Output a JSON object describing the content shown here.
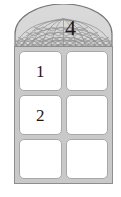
{
  "figure": {
    "name": "arched-window-with-geodesic-dome",
    "colors": {
      "frame": "#c9c9c9",
      "frame_border": "#8e8e8e",
      "pane_fill": "#ffffff",
      "pane_border": "#a8a8a8",
      "dome_fill": "#d6d6d6",
      "dome_lattice": "#8a8a8a",
      "label_text": "#1a1a1a",
      "background": "#ffffff"
    },
    "dome": {
      "label": "4",
      "pattern": "geodesic-triangular-lattice",
      "icon_name": "geodesic-dome-icon"
    },
    "panes": [
      {
        "row": 1,
        "col": 1,
        "label": "1"
      },
      {
        "row": 1,
        "col": 2,
        "label": ""
      },
      {
        "row": 2,
        "col": 1,
        "label": "2"
      },
      {
        "row": 2,
        "col": 2,
        "label": ""
      },
      {
        "row": 3,
        "col": 1,
        "label": ""
      },
      {
        "row": 3,
        "col": 2,
        "label": ""
      }
    ]
  }
}
